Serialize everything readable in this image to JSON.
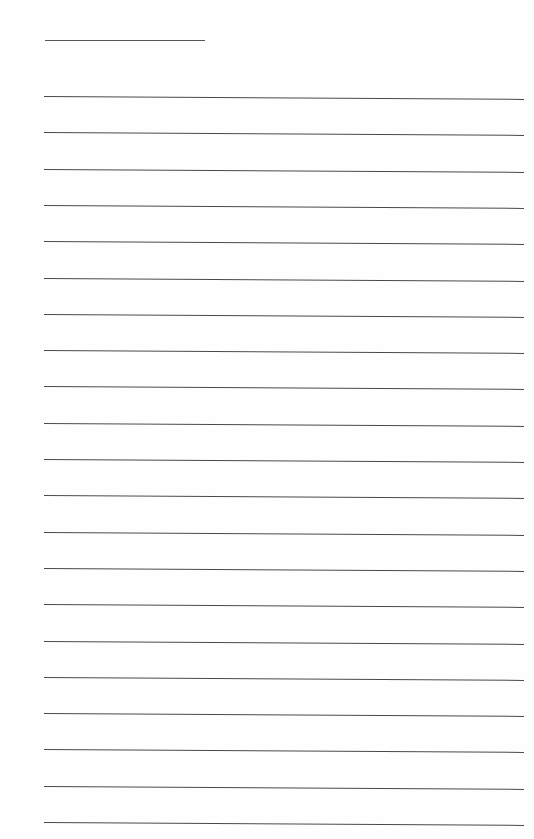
{
  "page": {
    "type": "blank-lined-writing-sheet",
    "background_color": "#fefefe",
    "line_color": "#4a4a4a",
    "title_line": {
      "left": 45,
      "top": 40,
      "width": 160
    },
    "rules": {
      "count": 21,
      "left": 44,
      "width": 480,
      "first_top": 96,
      "spacing": 36.3
    }
  }
}
